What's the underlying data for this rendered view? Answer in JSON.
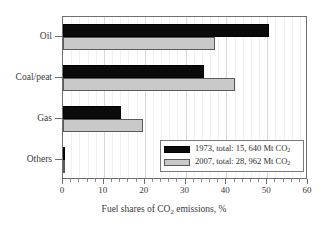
{
  "chart_data": {
    "type": "bar",
    "orientation": "horizontal",
    "title": "",
    "xlabel": "Fuel shares of CO2 emissions, %",
    "xlabel_parts": {
      "pre": "Fuel shares of CO",
      "sub": "2",
      "post": " emissions, %"
    },
    "ylabel": "",
    "categories": [
      "Oil",
      "Coal/peat",
      "Gas",
      "Others"
    ],
    "xlim": [
      0,
      60
    ],
    "xticks": [
      0,
      10,
      20,
      30,
      40,
      50,
      60
    ],
    "xticklabels": [
      "0",
      "10",
      "20",
      "30",
      "40",
      "50",
      "60"
    ],
    "minor_tick_step": 2,
    "grid": "vertical major and minor",
    "legend_position": "lower right inside axes",
    "series": [
      {
        "name": "1973, total: 15, 640 Mt CO2",
        "name_parts": {
          "pre": "1973, total: 15, 640 Mt CO",
          "sub": "2"
        },
        "color": "#0b0b0b",
        "values": [
          50.5,
          34.5,
          14.2,
          0.4
        ]
      },
      {
        "name": "2007, total: 28, 962 Mt CO2",
        "name_parts": {
          "pre": "2007, total: 28, 962 Mt CO",
          "sub": "2"
        },
        "color": "#c9c9c9",
        "values": [
          37.3,
          42.0,
          19.7,
          0.6
        ]
      }
    ]
  },
  "colors": {
    "series_1973": "#0b0b0b",
    "series_2007": "#c9c9c9",
    "axis": "#6f6f6f",
    "grid_major": "#d8d8d8",
    "grid_minor": "#f0f0f0",
    "text": "#3a3a3a",
    "background": "#ffffff"
  }
}
